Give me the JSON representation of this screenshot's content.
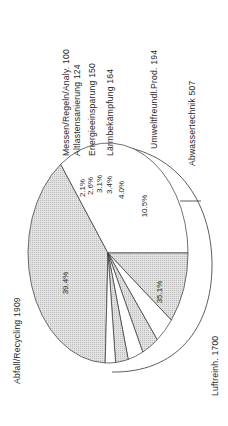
{
  "chart_data": {
    "type": "pie",
    "title": "",
    "orientation": "rotated-90-ccw",
    "unit": "",
    "categories": [
      "Abfall/Recycling",
      "Luftreinh.",
      "Abwassertechnik",
      "Umweltfreundl.Prod.",
      "Lärmbekämpfung",
      "Energieeinsparung",
      "Altlastensanierung",
      "Messen/Regeln/Analy."
    ],
    "values": [
      1909,
      1700,
      507,
      194,
      164,
      150,
      124,
      100
    ],
    "percent_labels": [
      "39.4%",
      "35.1%",
      "10.5%",
      "4.0%",
      "3.4%",
      "3.1%",
      "2.6%",
      "2.1%"
    ],
    "slices": [
      {
        "name": "Abfall/Recycling",
        "value": 1909,
        "percent": "39.4%",
        "label": "Abfall/Recycling 1909",
        "fill": "shaded"
      },
      {
        "name": "Luftreinh.",
        "value": 1700,
        "percent": "35.1%",
        "label": "Luftreinh. 1700",
        "fill": "white"
      },
      {
        "name": "Abwassertechnik",
        "value": 507,
        "percent": "10.5%",
        "label": "Abwassertechnik 507",
        "fill": "shaded"
      },
      {
        "name": "Umweltfreundl.Prod.",
        "value": 194,
        "percent": "4.0%",
        "label": "Umweltfreundl.Prod. 194",
        "fill": "white"
      },
      {
        "name": "Lärmbekämpfung",
        "value": 164,
        "percent": "3.4%",
        "label": "Lärmbekämpfung 164",
        "fill": "shaded"
      },
      {
        "name": "Energieeinsparung",
        "value": 150,
        "percent": "3.1%",
        "label": "Energieeinsparung 150",
        "fill": "white"
      },
      {
        "name": "Altlastensanierung",
        "value": 124,
        "percent": "2.6%",
        "label": "Altlastensanierung 124",
        "fill": "shaded"
      },
      {
        "name": "Messen/Regeln/Analy.",
        "value": 100,
        "percent": "2.1%",
        "label": "Messen/Regeln/Analy. 100",
        "fill": "white"
      }
    ],
    "style": {
      "shaded_color": "#d9d9d9",
      "white_color": "#ffffff",
      "stroke": "#333333",
      "three_d": true
    },
    "legend": "none (labels placed beside slices)"
  },
  "labels": {
    "abfall": "Abfall/Recycling 1909",
    "luft": "Luftreinh. 1700",
    "abwasser": "Abwassertechnik 507",
    "umwelt": "Umweltfreundl.Prod. 194",
    "laerm": "Lärmbekämpfung 164",
    "energie": "Energieeinsparung 150",
    "altlast": "Altlastensanierung 124",
    "messen": "Messen/Regeln/Analy. 100"
  },
  "pcts": {
    "abfall": "39.4%",
    "luft": "35.1%",
    "abwasser": "10.5%",
    "umwelt": "4.0%",
    "laerm": "3.4%",
    "energie": "3.1%",
    "altlast": "2.6%",
    "messen": "2.1%"
  }
}
